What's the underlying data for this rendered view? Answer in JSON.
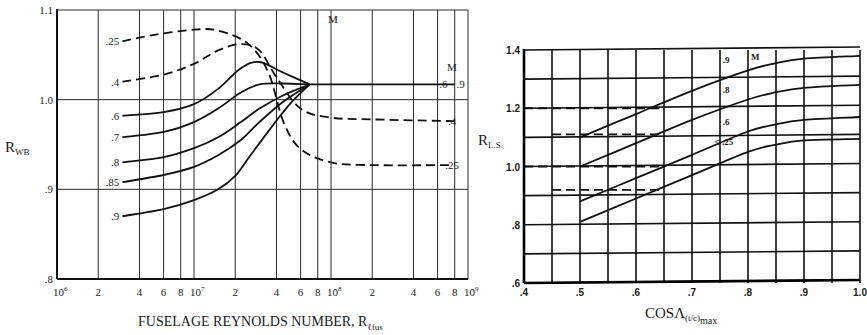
{
  "chart_data": [
    {
      "type": "line",
      "id": "left",
      "title": "",
      "xlabel": "FUSELAGE REYNOLDS NUMBER, R",
      "xlabel_sub": "ℓfus",
      "ylabel": "R",
      "ylabel_sub": "WB",
      "xscale": "log",
      "xlim": [
        1000000,
        1000000000
      ],
      "ylim": [
        0.8,
        1.1
      ],
      "grid": true,
      "legend_title": "M",
      "x_tick_labels": [
        {
          "value": 1000000,
          "label": "10",
          "exp": "6"
        },
        {
          "value": 2000000,
          "label": "2"
        },
        {
          "value": 4000000,
          "label": "4"
        },
        {
          "value": 6000000,
          "label": "6"
        },
        {
          "value": 8000000,
          "label": "8"
        },
        {
          "value": 10000000,
          "label": "10",
          "exp": "7"
        },
        {
          "value": 20000000,
          "label": "2"
        },
        {
          "value": 40000000,
          "label": "4"
        },
        {
          "value": 60000000,
          "label": "6"
        },
        {
          "value": 80000000,
          "label": "8"
        },
        {
          "value": 100000000,
          "label": "10",
          "exp": "8"
        },
        {
          "value": 200000000,
          "label": "2"
        },
        {
          "value": 400000000,
          "label": "4"
        },
        {
          "value": 600000000,
          "label": "6"
        },
        {
          "value": 800000000,
          "label": "8"
        },
        {
          "value": 1000000000,
          "label": "10",
          "exp": "9"
        }
      ],
      "y_tick_labels": [
        {
          "value": 1.1,
          "label": "1.1"
        },
        {
          "value": 1.0,
          "label": "1.0"
        },
        {
          "value": 0.9,
          "label": ".9"
        },
        {
          "value": 0.8,
          "label": ".8"
        }
      ],
      "series": [
        {
          "name": ".25",
          "style": "dashed",
          "label_side": "left",
          "x": [
            3000000,
            5000000,
            10000000,
            15000000,
            25000000,
            35000000,
            45000000,
            60000000,
            100000000,
            200000000,
            800000000
          ],
          "y": [
            1.065,
            1.072,
            1.078,
            1.077,
            1.062,
            1.03,
            0.975,
            0.945,
            0.93,
            0.927,
            0.927
          ]
        },
        {
          "name": ".4",
          "style": "dashed",
          "label_side": "left",
          "x": [
            3000000,
            6000000,
            10000000,
            15000000,
            22000000,
            30000000,
            40000000,
            60000000,
            100000000,
            200000000,
            800000000
          ],
          "y": [
            1.02,
            1.028,
            1.04,
            1.055,
            1.062,
            1.055,
            1.025,
            0.99,
            0.98,
            0.978,
            0.976
          ]
        },
        {
          "name": ".6",
          "style": "solid",
          "label_side": "left",
          "x": [
            3000000,
            6000000,
            10000000,
            15000000,
            22000000,
            30000000,
            45000000,
            70000000
          ],
          "y": [
            0.982,
            0.986,
            0.995,
            1.012,
            1.035,
            1.042,
            1.03,
            1.017
          ]
        },
        {
          "name": ".7",
          "style": "solid",
          "label_side": "left",
          "x": [
            3000000,
            6000000,
            10000000,
            15000000,
            22000000,
            30000000,
            45000000,
            70000000
          ],
          "y": [
            0.958,
            0.964,
            0.975,
            0.99,
            1.008,
            1.017,
            1.018,
            1.017
          ]
        },
        {
          "name": ".8",
          "style": "solid",
          "label_side": "left",
          "x": [
            3000000,
            6000000,
            10000000,
            15000000,
            22000000,
            30000000,
            45000000,
            70000000
          ],
          "y": [
            0.93,
            0.936,
            0.946,
            0.958,
            0.975,
            0.99,
            1.005,
            1.017
          ]
        },
        {
          "name": ".85",
          "style": "solid",
          "label_side": "left",
          "x": [
            3000000,
            6000000,
            10000000,
            15000000,
            22000000,
            30000000,
            45000000,
            70000000
          ],
          "y": [
            0.908,
            0.916,
            0.925,
            0.938,
            0.955,
            0.975,
            0.998,
            1.017
          ]
        },
        {
          "name": ".9",
          "style": "solid",
          "label_side": "left",
          "x": [
            3000000,
            6000000,
            10000000,
            15000000,
            20000000,
            25000000,
            35000000,
            50000000,
            70000000
          ],
          "y": [
            0.87,
            0.878,
            0.888,
            0.9,
            0.915,
            0.935,
            0.965,
            0.995,
            1.017
          ]
        },
        {
          "name": ".6 - .9",
          "style": "solid",
          "label_side": "right",
          "x": [
            70000000,
            800000000
          ],
          "y": [
            1.017,
            1.017
          ]
        }
      ],
      "right_labels": [
        {
          "text": "M",
          "y": 1.036
        },
        {
          "text": ".6 · .9",
          "y": 1.017
        },
        {
          "text": ".4",
          "y": 0.976
        },
        {
          "text": ".25",
          "y": 0.927
        }
      ]
    },
    {
      "type": "line",
      "id": "right",
      "title": "",
      "xlabel": "COSΛ",
      "xlabel_sub": "(t/c)",
      "xlabel_sub2": "max",
      "ylabel": "R",
      "ylabel_sub": "L.S.",
      "xlim": [
        0.4,
        1.0
      ],
      "ylim": [
        0.6,
        1.4
      ],
      "grid": true,
      "legend_title": "M",
      "x_tick_labels": [
        ".4",
        ".5",
        ".6",
        ".7",
        ".8",
        ".9",
        "1.0"
      ],
      "x_ticks": [
        0.4,
        0.5,
        0.6,
        0.7,
        0.8,
        0.9,
        1.0
      ],
      "y_tick_labels": [
        {
          "value": 0.6,
          "label": ".6"
        },
        {
          "value": 0.8,
          "label": ".8"
        },
        {
          "value": 1.0,
          "label": "1.0"
        },
        {
          "value": 1.2,
          "label": "1.2"
        },
        {
          "value": 1.4,
          "label": "1.4"
        }
      ],
      "series": [
        {
          "name": ".9",
          "style": "solid",
          "label": ".9",
          "x": [
            0.5,
            0.6,
            0.7,
            0.8,
            0.85,
            0.9,
            1.0
          ],
          "y": [
            1.1,
            1.18,
            1.26,
            1.33,
            1.355,
            1.37,
            1.38
          ]
        },
        {
          "name": ".8",
          "style": "solid",
          "label": ".8",
          "x": [
            0.5,
            0.6,
            0.7,
            0.8,
            0.85,
            0.9,
            1.0
          ],
          "y": [
            1.0,
            1.08,
            1.16,
            1.23,
            1.255,
            1.27,
            1.28
          ]
        },
        {
          "name": ".6",
          "style": "solid",
          "label": ".6",
          "x": [
            0.5,
            0.6,
            0.7,
            0.8,
            0.85,
            0.9,
            1.0
          ],
          "y": [
            0.88,
            0.96,
            1.04,
            1.12,
            1.145,
            1.16,
            1.17
          ]
        },
        {
          "name": "≤ .25",
          "style": "solid",
          "label": "≤ .25",
          "x": [
            0.5,
            0.6,
            0.7,
            0.8,
            0.85,
            0.9,
            1.0
          ],
          "y": [
            0.81,
            0.89,
            0.97,
            1.05,
            1.075,
            1.09,
            1.095
          ]
        }
      ],
      "dashed_reference_lines": [
        {
          "y": 1.2,
          "x_from": 0.4,
          "x_to": 0.65
        },
        {
          "y": 1.11,
          "x_from": 0.45,
          "x_to": 0.65
        },
        {
          "y": 1.0,
          "x_from": 0.4,
          "x_to": 0.65
        },
        {
          "y": 0.92,
          "x_from": 0.45,
          "x_to": 0.65
        }
      ]
    }
  ],
  "labels": {
    "left_ylabel": "R",
    "left_ylabel_sub": "WB",
    "left_xlabel": "FUSELAGE REYNOLDS NUMBER, R",
    "left_xlabel_sub": "ℓfus",
    "left_legend_title": "M",
    "right_ylabel": "R",
    "right_ylabel_sub": "L.S.",
    "right_xlabel": "COSΛ",
    "right_xlabel_sub": "(t/c)",
    "right_xlabel_sub2": "max",
    "right_legend_title": "M"
  }
}
